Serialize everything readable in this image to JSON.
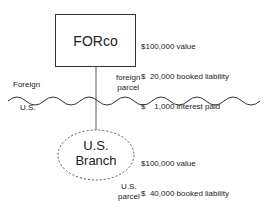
{
  "diagram": {
    "foreign_entity": {
      "label": "FORco",
      "details": [
        "$100,000 value",
        "$  20,000 booked liability",
        "$    1,000 interest paid"
      ]
    },
    "us_branch": {
      "label_line1": "U.S.",
      "label_line2": "Branch",
      "details": [
        "$100,000 value",
        "$  40,000 booked liability",
        "$    3,000 interest paid"
      ]
    },
    "regions": {
      "foreign": "Foreign",
      "us": "U.S."
    },
    "parcels": {
      "foreign_line1": "foreign",
      "foreign_line2": "parcel",
      "us_line1": "U.S.",
      "us_line2": "parcel"
    }
  }
}
